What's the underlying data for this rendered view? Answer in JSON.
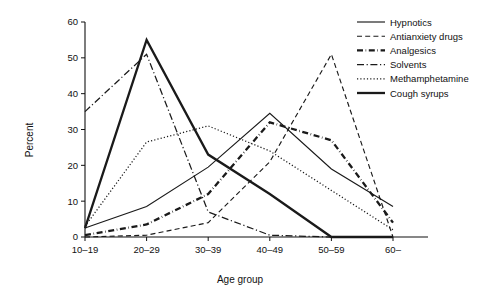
{
  "chart_data": {
    "type": "line",
    "title": "",
    "xlabel": "Age group",
    "ylabel": "Percent",
    "categories": [
      "10–19",
      "20–29",
      "30–39",
      "40–49",
      "50–59",
      "60–"
    ],
    "ylim": [
      0,
      60
    ],
    "yticks": [
      0,
      10,
      20,
      30,
      40,
      50,
      60
    ],
    "ytick_labels": [
      "0",
      "10",
      "20",
      "30",
      "40",
      "50",
      "60"
    ],
    "grid": false,
    "legend_position": "top-right",
    "series": [
      {
        "name": "Hypnotics",
        "style": "solid-thin",
        "values": [
          2.5,
          8.5,
          19.5,
          34.5,
          19,
          8.5
        ]
      },
      {
        "name": "Antianxiety drugs",
        "style": "dashed",
        "values": [
          0,
          0.5,
          4,
          21,
          51,
          0
        ]
      },
      {
        "name": "Analgesics",
        "style": "dash-dot-thick",
        "values": [
          0.5,
          3.5,
          12,
          32,
          27,
          4
        ]
      },
      {
        "name": "Solvents",
        "style": "dash-dot",
        "values": [
          35,
          51,
          7,
          0.5,
          0,
          0
        ]
      },
      {
        "name": "Methamphetamine",
        "style": "dotted",
        "values": [
          3,
          26.5,
          31,
          24,
          13,
          2
        ]
      },
      {
        "name": "Cough syrups",
        "style": "solid-thick",
        "values": [
          2.5,
          55,
          23,
          12,
          0,
          0
        ]
      }
    ]
  },
  "axes": {
    "y_label": "Percent",
    "x_label": "Age group"
  },
  "colors": {
    "ink": "#1a1a1a",
    "background": "#ffffff"
  }
}
